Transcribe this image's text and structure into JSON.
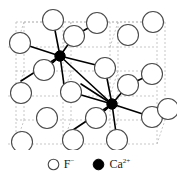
{
  "figure": {
    "type": "crystal-structure-diagram",
    "colors": {
      "anion_stroke": "#4a4a4a",
      "anion_fill": "#ffffff",
      "cation_fill": "#000000",
      "bond": "#000000",
      "grid": "#b9b9b9",
      "text": "#1a1a1a",
      "background": "#ffffff"
    },
    "geometry": {
      "anion_radius": 10.5,
      "cation_radius": 5.2,
      "anion_stroke_width": 1.1,
      "bond_stroke_width": 1.6,
      "grid_stroke_width": 0.8,
      "grid_dash": "2,2"
    }
  },
  "lattice": {
    "grid_lines": [
      {
        "name": "grid-h-0",
        "x1": 16,
        "y1": 22,
        "x2": 163,
        "y2": 22
      },
      {
        "name": "grid-h-1",
        "x1": 8,
        "y1": 47,
        "x2": 155,
        "y2": 47
      },
      {
        "name": "grid-h-2",
        "x1": 16,
        "y1": 71,
        "x2": 163,
        "y2": 71
      },
      {
        "name": "grid-h-3",
        "x1": 8,
        "y1": 96,
        "x2": 155,
        "y2": 96
      },
      {
        "name": "grid-h-4",
        "x1": 16,
        "y1": 120,
        "x2": 163,
        "y2": 120
      },
      {
        "name": "grid-h-5",
        "x1": 8,
        "y1": 144,
        "x2": 155,
        "y2": 144
      },
      {
        "name": "grid-v-0",
        "x1": 16,
        "y1": 22,
        "x2": 16,
        "y2": 144
      },
      {
        "name": "grid-v-1",
        "x1": 63,
        "y1": 22,
        "x2": 63,
        "y2": 144
      },
      {
        "name": "grid-v-2",
        "x1": 110,
        "y1": 22,
        "x2": 110,
        "y2": 144
      },
      {
        "name": "grid-v-3",
        "x1": 157,
        "y1": 22,
        "x2": 157,
        "y2": 144
      },
      {
        "name": "grid-d-0",
        "x1": 16,
        "y1": 47,
        "x2": 24,
        "y2": 22
      },
      {
        "name": "grid-d-1",
        "x1": 63,
        "y1": 47,
        "x2": 71,
        "y2": 22
      },
      {
        "name": "grid-d-2",
        "x1": 110,
        "y1": 47,
        "x2": 118,
        "y2": 22
      },
      {
        "name": "grid-d-3",
        "x1": 16,
        "y1": 96,
        "x2": 24,
        "y2": 71
      },
      {
        "name": "grid-d-4",
        "x1": 63,
        "y1": 96,
        "x2": 71,
        "y2": 71
      },
      {
        "name": "grid-d-5",
        "x1": 110,
        "y1": 96,
        "x2": 118,
        "y2": 71
      },
      {
        "name": "grid-d-6",
        "x1": 16,
        "y1": 144,
        "x2": 24,
        "y2": 120
      },
      {
        "name": "grid-d-7",
        "x1": 63,
        "y1": 144,
        "x2": 71,
        "y2": 120
      },
      {
        "name": "grid-d-8",
        "x1": 110,
        "y1": 144,
        "x2": 118,
        "y2": 120
      },
      {
        "name": "grid-d-9",
        "x1": 157,
        "y1": 144,
        "x2": 165,
        "y2": 120
      },
      {
        "name": "grid-h-back-0",
        "x1": 24,
        "y1": 22,
        "x2": 165,
        "y2": 22
      },
      {
        "name": "grid-v-back-0",
        "x1": 24,
        "y1": 22,
        "x2": 24,
        "y2": 120
      },
      {
        "name": "grid-v-back-1",
        "x1": 71,
        "y1": 22,
        "x2": 71,
        "y2": 120
      },
      {
        "name": "grid-v-back-2",
        "x1": 118,
        "y1": 22,
        "x2": 118,
        "y2": 120
      },
      {
        "name": "grid-v-back-3",
        "x1": 165,
        "y1": 22,
        "x2": 165,
        "y2": 120
      }
    ],
    "bonds": [
      {
        "name": "bond-ca1-f-up",
        "x1": 60,
        "y1": 56,
        "x2": 53,
        "y2": 20
      },
      {
        "name": "bond-ca1-f-upright",
        "x1": 60,
        "y1": 56,
        "x2": 74,
        "y2": 36
      },
      {
        "name": "bond-ca1-f-right",
        "x1": 60,
        "y1": 56,
        "x2": 112,
        "y2": 69
      },
      {
        "name": "bond-ca1-f-left",
        "x1": 60,
        "y1": 56,
        "x2": 20,
        "y2": 43
      },
      {
        "name": "bond-ca1-f-downleft",
        "x1": 60,
        "y1": 56,
        "x2": 21,
        "y2": 81
      },
      {
        "name": "bond-ca1-f-down",
        "x1": 60,
        "y1": 56,
        "x2": 44,
        "y2": 70
      },
      {
        "name": "bond-ca1-f-downright",
        "x1": 60,
        "y1": 56,
        "x2": 65,
        "y2": 92
      },
      {
        "name": "bond-ca1-f-back",
        "x1": 60,
        "y1": 56,
        "x2": 47,
        "y2": 68
      },
      {
        "name": "bond-ca1-ca2-link",
        "x1": 60,
        "y1": 56,
        "x2": 112,
        "y2": 104
      },
      {
        "name": "bond-ca2-f-up",
        "x1": 112,
        "y1": 104,
        "x2": 105,
        "y2": 68
      },
      {
        "name": "bond-ca2-f-upleft",
        "x1": 112,
        "y1": 104,
        "x2": 81,
        "y2": 84
      },
      {
        "name": "bond-ca2-f-upright",
        "x1": 112,
        "y1": 104,
        "x2": 128,
        "y2": 85
      },
      {
        "name": "bond-ca2-f-right",
        "x1": 112,
        "y1": 104,
        "x2": 152,
        "y2": 117
      },
      {
        "name": "bond-ca2-f-left",
        "x1": 112,
        "y1": 104,
        "x2": 71,
        "y2": 92
      },
      {
        "name": "bond-ca2-f-downleft",
        "x1": 112,
        "y1": 104,
        "x2": 73,
        "y2": 130
      },
      {
        "name": "bond-ca2-f-down",
        "x1": 112,
        "y1": 104,
        "x2": 96,
        "y2": 118
      },
      {
        "name": "bond-ca2-f-downright",
        "x1": 112,
        "y1": 104,
        "x2": 117,
        "y2": 140
      },
      {
        "name": "bond-ca2-f-back",
        "x1": 112,
        "y1": 104,
        "x2": 99,
        "y2": 116
      },
      {
        "name": "bond-edge-f-topright",
        "x1": 128,
        "y1": 85,
        "x2": 152,
        "y2": 74
      },
      {
        "name": "bond-edge-f-toprow",
        "x1": 74,
        "y1": 36,
        "x2": 97,
        "y2": 23
      },
      {
        "name": "bond-edge-f-bottomr",
        "x1": 152,
        "y1": 117,
        "x2": 168,
        "y2": 109
      }
    ],
    "anions": [
      {
        "name": "f-ion",
        "cx": 53,
        "cy": 20
      },
      {
        "name": "f-ion",
        "cx": 97,
        "cy": 23
      },
      {
        "name": "f-ion",
        "cx": 153,
        "cy": 22
      },
      {
        "name": "f-ion",
        "cx": 20,
        "cy": 43
      },
      {
        "name": "f-ion",
        "cx": 74,
        "cy": 36
      },
      {
        "name": "f-ion",
        "cx": 128,
        "cy": 35
      },
      {
        "name": "f-ion",
        "cx": 44,
        "cy": 70
      },
      {
        "name": "f-ion",
        "cx": 105,
        "cy": 68
      },
      {
        "name": "f-ion",
        "cx": 152,
        "cy": 74
      },
      {
        "name": "f-ion",
        "cx": 21,
        "cy": 93
      },
      {
        "name": "f-ion",
        "cx": 71,
        "cy": 92
      },
      {
        "name": "f-ion",
        "cx": 128,
        "cy": 85
      },
      {
        "name": "f-ion",
        "cx": 47,
        "cy": 118
      },
      {
        "name": "f-ion",
        "cx": 96,
        "cy": 118
      },
      {
        "name": "f-ion",
        "cx": 152,
        "cy": 117
      },
      {
        "name": "f-ion",
        "cx": 22,
        "cy": 142
      },
      {
        "name": "f-ion",
        "cx": 73,
        "cy": 140
      },
      {
        "name": "f-ion",
        "cx": 117,
        "cy": 140
      },
      {
        "name": "f-ion",
        "cx": 168,
        "cy": 109
      }
    ],
    "cations": [
      {
        "name": "ca-ion",
        "cx": 60,
        "cy": 56
      },
      {
        "name": "ca-ion",
        "cx": 112,
        "cy": 104
      }
    ]
  },
  "legend": {
    "items": [
      {
        "symbol": "open-circle",
        "label": "F",
        "charge": "−",
        "species": "fluoride"
      },
      {
        "symbol": "filled-circle",
        "label": "Ca",
        "charge": "2+",
        "species": "calcium"
      }
    ]
  }
}
